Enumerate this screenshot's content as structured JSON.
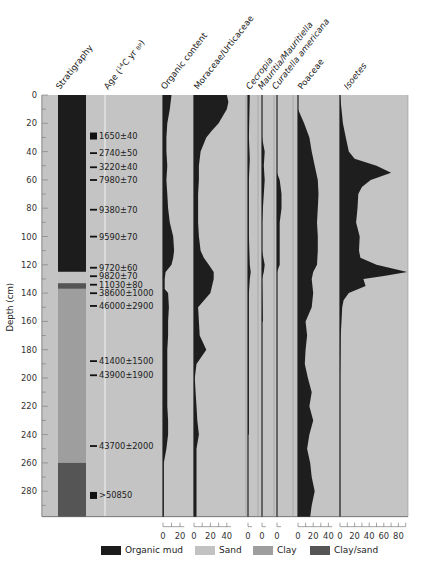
{
  "chart_data": {
    "type": "area",
    "title": "",
    "ylabel": "Depth (cm)",
    "ylim": [
      0,
      298
    ],
    "yticks": [
      0,
      20,
      40,
      60,
      80,
      100,
      120,
      140,
      160,
      180,
      200,
      220,
      240,
      260,
      280
    ],
    "grid": false,
    "columns": [
      {
        "name": "Stratigraphy"
      },
      {
        "name": "Age (14C yr BP)"
      },
      {
        "name": "Organic content",
        "xticks": [
          "0",
          "20"
        ]
      },
      {
        "name": "Moraceae/Urticaceae",
        "xticks": [
          "0",
          "20",
          "40"
        ]
      },
      {
        "name": "Cecropia",
        "xticks": [
          "0"
        ]
      },
      {
        "name": "Mauritia/Mauritiella",
        "xticks": [
          "0"
        ]
      },
      {
        "name": "Curatella americana",
        "xticks": [
          "0"
        ]
      },
      {
        "name": "Poaceae",
        "xticks": [
          "0",
          "20",
          "40"
        ]
      },
      {
        "name": "Isoetes",
        "xticks": [
          "0",
          "20",
          "40",
          "60",
          "80"
        ]
      }
    ],
    "stratigraphy": [
      {
        "from": 0,
        "to": 125,
        "type": "Organic mud"
      },
      {
        "from": 125,
        "to": 133,
        "type": "Sand"
      },
      {
        "from": 133,
        "to": 137,
        "type": "Clay/sand"
      },
      {
        "from": 137,
        "to": 260,
        "type": "Clay"
      },
      {
        "from": 260,
        "to": 298,
        "type": "Clay/sand"
      }
    ],
    "ages": [
      {
        "depth": 29,
        "label": "1650±40",
        "marker": "square"
      },
      {
        "depth": 41,
        "label": "2740±50",
        "marker": "dash"
      },
      {
        "depth": 51,
        "label": "3220±40",
        "marker": "dash"
      },
      {
        "depth": 60,
        "label": "7980±70",
        "marker": "dash"
      },
      {
        "depth": 81,
        "label": "9380±70",
        "marker": "dash"
      },
      {
        "depth": 100,
        "label": "9590±70",
        "marker": "dash"
      },
      {
        "depth": 122,
        "label": "9720±60",
        "marker": "dash"
      },
      {
        "depth": 128,
        "label": "9820±70",
        "marker": "dash"
      },
      {
        "depth": 134,
        "label": "11030±80",
        "marker": "dash"
      },
      {
        "depth": 140,
        "label": "38600±1000",
        "marker": "dash"
      },
      {
        "depth": 149,
        "label": "46000±2900",
        "marker": "dash"
      },
      {
        "depth": 188,
        "label": "41400±1500",
        "marker": "dash"
      },
      {
        "depth": 198,
        "label": "43900±1900",
        "marker": "dash"
      },
      {
        "depth": 248,
        "label": "43700±2000",
        "marker": "dash"
      },
      {
        "depth": 283,
        "label": ">50850",
        "marker": "square"
      }
    ],
    "series": [
      {
        "name": "Organic content",
        "unit": "%",
        "depth": [
          0,
          10,
          20,
          30,
          40,
          50,
          60,
          70,
          80,
          90,
          100,
          110,
          115,
          120,
          125,
          130,
          137,
          140,
          150,
          160,
          170,
          180,
          190,
          200,
          210,
          220,
          230,
          240,
          250,
          260,
          270,
          280,
          290,
          298
        ],
        "values": [
          10,
          8,
          5,
          4,
          4,
          5,
          4,
          5,
          6,
          8,
          12,
          13,
          12,
          10,
          3,
          2,
          2,
          6,
          7,
          6,
          6,
          5,
          5,
          5,
          5,
          5,
          6,
          6,
          4,
          1,
          1,
          1,
          1,
          1
        ]
      },
      {
        "name": "Moraceae/Urticaceae",
        "unit": "%",
        "depth": [
          0,
          5,
          10,
          15,
          20,
          25,
          30,
          40,
          50,
          60,
          70,
          80,
          90,
          100,
          110,
          115,
          120,
          125,
          130,
          140,
          150,
          160,
          170,
          180,
          190,
          200,
          210,
          220,
          230,
          240,
          250,
          260,
          270,
          280,
          290,
          298
        ],
        "values": [
          40,
          42,
          40,
          35,
          30,
          22,
          15,
          8,
          6,
          6,
          5,
          5,
          5,
          6,
          8,
          12,
          18,
          24,
          24,
          20,
          5,
          6,
          7,
          15,
          3,
          1,
          2,
          3,
          4,
          6,
          3,
          3,
          3,
          3,
          3,
          3
        ]
      },
      {
        "name": "Cecropia",
        "unit": "%",
        "depth": [
          0,
          30,
          45,
          60,
          80,
          100,
          120,
          125,
          130,
          140,
          170,
          200,
          240
        ],
        "values": [
          2,
          1,
          2,
          1,
          1,
          1,
          2,
          3,
          2,
          1,
          1,
          1,
          1
        ]
      },
      {
        "name": "Mauritia/Mauritiella",
        "unit": "%",
        "depth": [
          0,
          30,
          40,
          50,
          60,
          90,
          110,
          120,
          125,
          130,
          160
        ],
        "values": [
          0,
          0,
          3,
          2,
          3,
          0,
          0,
          3,
          2,
          0,
          1
        ]
      },
      {
        "name": "Curatella americana",
        "unit": "%",
        "depth": [
          0,
          55,
          60,
          70,
          80,
          90,
          100,
          110,
          120,
          125,
          130
        ],
        "values": [
          0,
          0,
          3,
          5,
          5,
          3,
          3,
          3,
          3,
          0,
          0
        ]
      },
      {
        "name": "Poaceae",
        "unit": "%",
        "depth": [
          0,
          10,
          20,
          30,
          40,
          50,
          60,
          70,
          80,
          90,
          100,
          110,
          120,
          125,
          130,
          140,
          150,
          160,
          170,
          180,
          190,
          200,
          210,
          220,
          230,
          240,
          250,
          260,
          270,
          280,
          290,
          298
        ],
        "values": [
          0,
          0,
          8,
          15,
          18,
          22,
          26,
          27,
          26,
          25,
          26,
          26,
          25,
          20,
          18,
          20,
          18,
          10,
          12,
          10,
          9,
          13,
          18,
          15,
          20,
          15,
          12,
          16,
          18,
          22,
          18,
          16
        ]
      },
      {
        "name": "Isoetes",
        "unit": "%",
        "depth": [
          0,
          10,
          20,
          30,
          40,
          45,
          50,
          55,
          60,
          65,
          70,
          80,
          90,
          100,
          110,
          115,
          120,
          125,
          128,
          130,
          135,
          140,
          145,
          150,
          160,
          170,
          200,
          298
        ],
        "values": [
          0,
          2,
          4,
          8,
          12,
          20,
          50,
          70,
          42,
          30,
          25,
          24,
          22,
          27,
          26,
          28,
          50,
          92,
          60,
          32,
          35,
          12,
          5,
          3,
          2,
          1,
          0,
          0
        ]
      }
    ],
    "legend": [
      {
        "label": "Organic mud",
        "color": "#1c1c1c"
      },
      {
        "label": "Sand",
        "color": "#c2c2c2"
      },
      {
        "label": "Clay",
        "color": "#9e9e9e"
      },
      {
        "label": "Clay/sand",
        "color": "#555555"
      }
    ]
  }
}
